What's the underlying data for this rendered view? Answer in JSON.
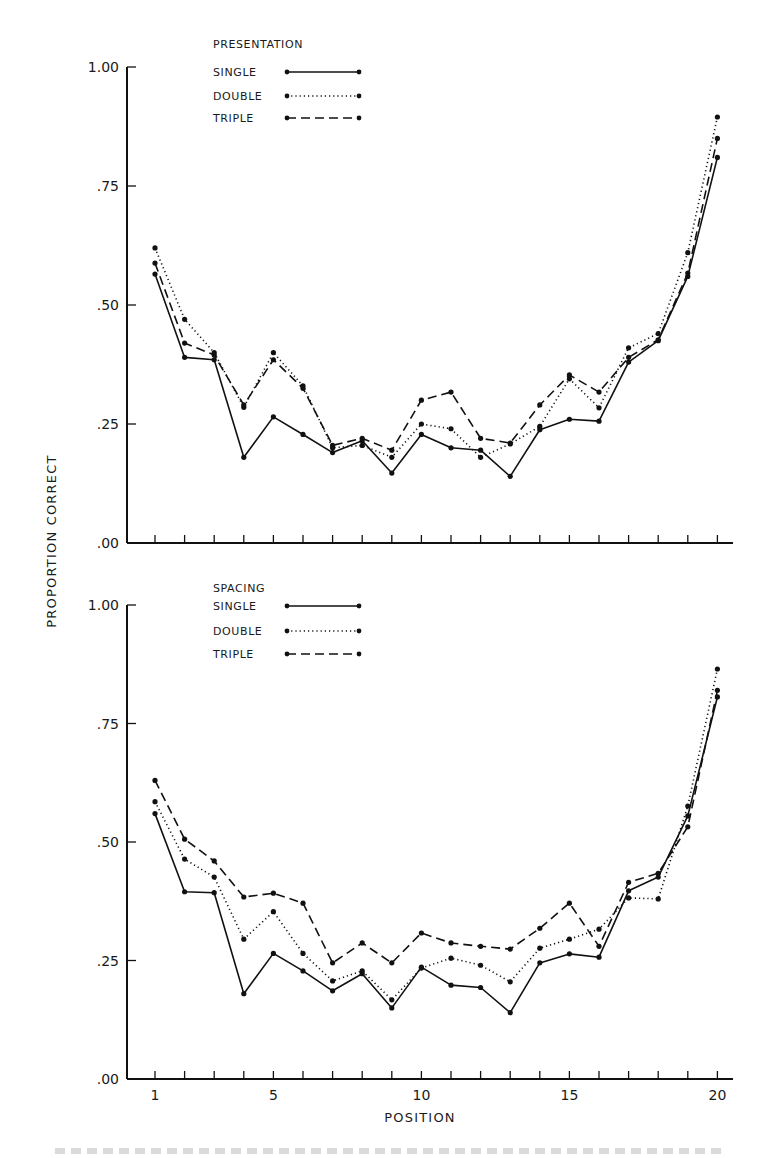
{
  "figure": {
    "ylabel": "PROPORTION CORRECT",
    "xlabel": "POSITION",
    "x_ticks": [
      1,
      5,
      10,
      15,
      20
    ],
    "x_tick_labels": [
      "1",
      "5",
      "10",
      "15",
      "20"
    ],
    "y_tick_labels": [
      "1.00",
      ".75",
      ".50",
      ".25",
      ".00"
    ]
  },
  "styles": {
    "line_color": "#111111",
    "SINGLE": "solid",
    "DOUBLE": "dotted",
    "TRIPLE": "dashed"
  },
  "chart_data": [
    {
      "type": "line",
      "panel": "top",
      "title": "",
      "legend_title": "PRESENTATION",
      "legend_position": "upper-center",
      "xlabel": "POSITION",
      "ylabel": "PROPORTION CORRECT",
      "ylim": [
        0,
        1
      ],
      "xlim": [
        1,
        20
      ],
      "y_ticks": [
        0,
        0.25,
        0.5,
        0.75,
        1.0
      ],
      "grid": false,
      "x": [
        1,
        2,
        3,
        4,
        5,
        6,
        7,
        8,
        9,
        10,
        11,
        12,
        13,
        14,
        15,
        16,
        17,
        18,
        19,
        20
      ],
      "series": [
        {
          "name": "SINGLE",
          "style": "solid",
          "values": [
            0.565,
            0.39,
            0.385,
            0.18,
            0.265,
            0.228,
            0.19,
            0.215,
            0.147,
            0.228,
            0.2,
            0.195,
            0.14,
            0.238,
            0.26,
            0.256,
            0.38,
            0.425,
            0.56,
            0.81
          ]
        },
        {
          "name": "DOUBLE",
          "style": "dotted",
          "values": [
            0.62,
            0.47,
            0.4,
            0.285,
            0.4,
            0.33,
            0.2,
            0.205,
            0.18,
            0.25,
            0.24,
            0.18,
            0.208,
            0.245,
            0.345,
            0.284,
            0.41,
            0.44,
            0.61,
            0.895
          ]
        },
        {
          "name": "TRIPLE",
          "style": "dashed",
          "values": [
            0.588,
            0.42,
            0.395,
            0.29,
            0.385,
            0.325,
            0.205,
            0.22,
            0.195,
            0.3,
            0.317,
            0.22,
            0.21,
            0.29,
            0.353,
            0.317,
            0.39,
            0.427,
            0.567,
            0.85
          ]
        }
      ]
    },
    {
      "type": "line",
      "panel": "bottom",
      "title": "",
      "legend_title": "SPACING",
      "legend_position": "upper-center",
      "xlabel": "POSITION",
      "ylabel": "PROPORTION CORRECT",
      "ylim": [
        0,
        1
      ],
      "xlim": [
        1,
        20
      ],
      "y_ticks": [
        0,
        0.25,
        0.5,
        0.75,
        1.0
      ],
      "grid": false,
      "x": [
        1,
        2,
        3,
        4,
        5,
        6,
        7,
        8,
        9,
        10,
        11,
        12,
        13,
        14,
        15,
        16,
        17,
        18,
        19,
        20
      ],
      "series": [
        {
          "name": "SINGLE",
          "style": "solid",
          "values": [
            0.56,
            0.395,
            0.393,
            0.18,
            0.265,
            0.228,
            0.186,
            0.222,
            0.15,
            0.236,
            0.198,
            0.193,
            0.14,
            0.245,
            0.264,
            0.257,
            0.397,
            0.426,
            0.555,
            0.806
          ]
        },
        {
          "name": "DOUBLE",
          "style": "dotted",
          "values": [
            0.585,
            0.464,
            0.426,
            0.295,
            0.353,
            0.265,
            0.207,
            0.228,
            0.167,
            0.234,
            0.255,
            0.24,
            0.205,
            0.276,
            0.295,
            0.316,
            0.382,
            0.38,
            0.576,
            0.865
          ]
        },
        {
          "name": "TRIPLE",
          "style": "dashed",
          "values": [
            0.63,
            0.506,
            0.46,
            0.384,
            0.392,
            0.371,
            0.245,
            0.287,
            0.245,
            0.308,
            0.287,
            0.28,
            0.274,
            0.318,
            0.371,
            0.28,
            0.415,
            0.434,
            0.532,
            0.82
          ]
        }
      ]
    }
  ]
}
